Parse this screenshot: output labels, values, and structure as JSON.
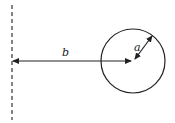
{
  "diagram": {
    "type": "physics-geometry",
    "labels": {
      "distance": "b",
      "radius": "a"
    },
    "colors": {
      "stroke": "#222222",
      "background": "#ffffff"
    },
    "elements": {
      "axis_line": {
        "x": 12,
        "y1": 5,
        "y2": 120,
        "style": "dashed"
      },
      "circle": {
        "cx": 133,
        "cy": 61,
        "r": 32
      },
      "distance_arrow": {
        "x1": 13,
        "y1": 61,
        "x2": 131,
        "y2": 61,
        "heads": "both"
      },
      "radius_arrow": {
        "x1": 135,
        "y1": 59,
        "x2": 152,
        "y2": 36,
        "heads": "both"
      }
    }
  }
}
